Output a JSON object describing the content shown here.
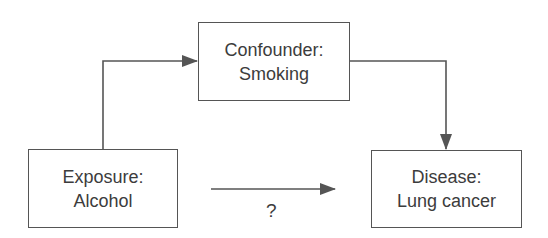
{
  "diagram": {
    "type": "causal-confounding-diagram",
    "nodes": [
      {
        "id": "confounder",
        "label_line1": "Confounder:",
        "label_line2": "Smoking"
      },
      {
        "id": "exposure",
        "label_line1": "Exposure:",
        "label_line2": "Alcohol"
      },
      {
        "id": "disease",
        "label_line1": "Disease:",
        "label_line2": "Lung cancer"
      }
    ],
    "edges": [
      {
        "from": "exposure",
        "to": "confounder",
        "style": "elbow-arrow"
      },
      {
        "from": "confounder",
        "to": "disease",
        "style": "elbow-arrow"
      },
      {
        "from": "exposure",
        "to": "disease",
        "style": "straight-arrow",
        "label": "?"
      }
    ],
    "question_label": "?",
    "colors": {
      "line": "#555555",
      "text": "#3c3c3c",
      "background": "#ffffff"
    }
  }
}
